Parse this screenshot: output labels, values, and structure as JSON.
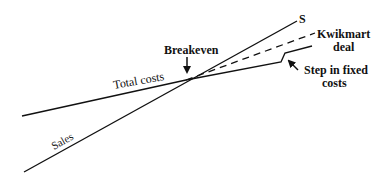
{
  "diagram": {
    "type": "breakeven-chart",
    "colors": {
      "ink": "#111111",
      "background": "#ffffff"
    },
    "labels": {
      "breakeven": "Breakeven",
      "total_costs": "Total costs",
      "sales": "Sales",
      "s_end": "S",
      "kwikmart_line1": "Kwikmart",
      "kwikmart_line2": "deal",
      "step_line1": "Step in fixed",
      "step_line2": "costs"
    },
    "lines": [
      {
        "name": "sales",
        "style": "solid",
        "points": [
          [
            24,
            172
          ],
          [
            297,
            21
          ]
        ]
      },
      {
        "name": "total-costs",
        "style": "solid",
        "points": [
          [
            22,
            116
          ],
          [
            186,
            80
          ],
          [
            281,
            62
          ],
          [
            285,
            53
          ],
          [
            312,
            46
          ]
        ]
      },
      {
        "name": "kwikmart-deal",
        "style": "dashed",
        "points": [
          [
            186,
            80
          ],
          [
            315,
            33
          ]
        ]
      }
    ],
    "arrows": [
      {
        "name": "breakeven-arrow",
        "from": [
          187,
          57
        ],
        "to": [
          187,
          78
        ]
      },
      {
        "name": "step-arrow",
        "from": [
          298,
          70
        ],
        "to": [
          285,
          58
        ]
      }
    ]
  }
}
